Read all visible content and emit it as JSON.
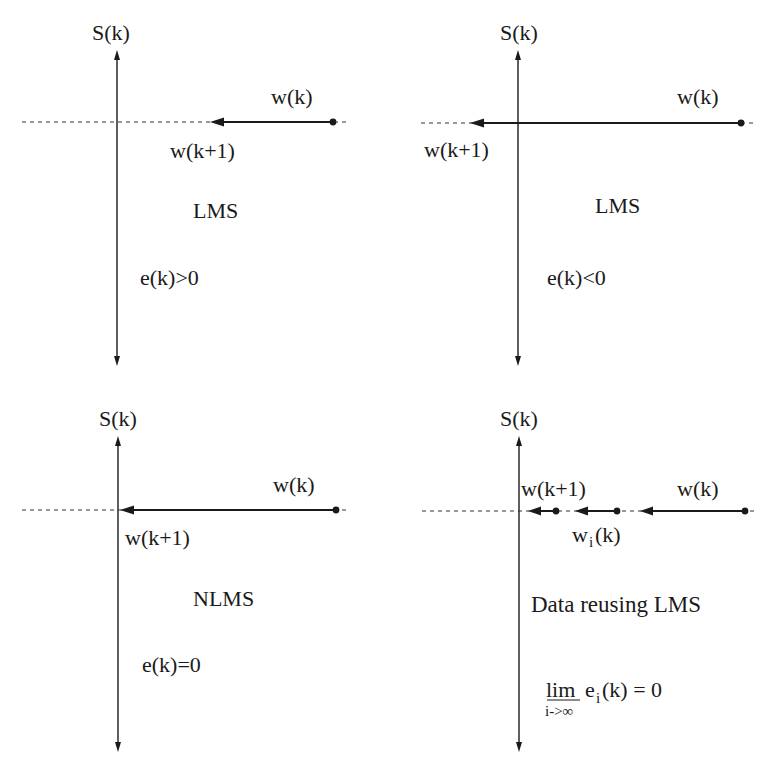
{
  "figure": {
    "panels": [
      {
        "id": "lms-positive-error",
        "axis_label": "S(k)",
        "start_label": "w(k)",
        "end_label": "w(k+1)",
        "algorithm_label": "LMS",
        "condition_label": "e(k)>0"
      },
      {
        "id": "lms-negative-error",
        "axis_label": "S(k)",
        "start_label": "w(k)",
        "end_label": "w(k+1)",
        "algorithm_label": "LMS",
        "condition_label": "e(k)<0"
      },
      {
        "id": "nlms",
        "axis_label": "S(k)",
        "start_label": "w(k)",
        "end_label": "w(k+1)",
        "algorithm_label": "NLMS",
        "condition_label": "e(k)=0"
      },
      {
        "id": "data-reusing-lms",
        "axis_label": "S(k)",
        "start_label": "w(k)",
        "end_label": "w(k+1)",
        "intermediate_label_main": "w",
        "intermediate_label_sub": "i",
        "intermediate_label_tail": "(k)",
        "algorithm_label": "Data reusing LMS",
        "condition_lim": "lim",
        "condition_lim_sub": "i->∞",
        "condition_expr_main": "e",
        "condition_expr_sub": "i",
        "condition_expr_tail": "(k) = 0"
      }
    ]
  }
}
